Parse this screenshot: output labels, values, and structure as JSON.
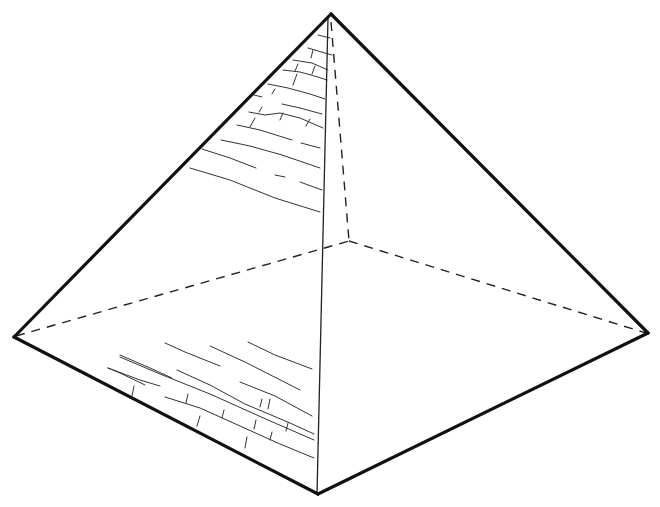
{
  "diagram": {
    "style": "line drawing with hidden edges dashed and stone-block hatching",
    "colors": {
      "background": "#ffffff",
      "line": "#111111"
    },
    "vertices": {
      "apex": [
        331,
        14
      ],
      "left": [
        14,
        337
      ],
      "right": [
        648,
        333
      ],
      "front": [
        318,
        494
      ],
      "back": [
        349,
        241
      ]
    },
    "visible_edges": [
      [
        "apex",
        "left"
      ],
      [
        "apex",
        "right"
      ],
      [
        "left",
        "front"
      ],
      [
        "front",
        "right"
      ],
      [
        "apex",
        "front"
      ]
    ],
    "hidden_edges": [
      [
        "apex",
        "back"
      ],
      [
        "left",
        "back"
      ],
      [
        "back",
        "right"
      ]
    ],
    "hatching": {
      "upper_left_face_rows": 11,
      "lower_left_face_rows": 8
    }
  }
}
